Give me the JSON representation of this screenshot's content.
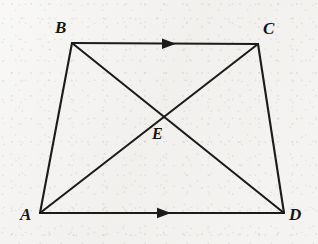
{
  "figure": {
    "background_color": "#f3f2f0",
    "line_color": "#1b1b1b",
    "label_color": "#151515",
    "width": 318,
    "height": 244
  },
  "points": {
    "A": {
      "label": "A",
      "x": 40,
      "y": 213,
      "label_x": 20,
      "label_y": 206
    },
    "B": {
      "label": "B",
      "x": 72,
      "y": 43,
      "label_x": 55,
      "label_y": 19
    },
    "C": {
      "label": "C",
      "x": 258,
      "y": 44,
      "label_x": 263,
      "label_y": 20
    },
    "D": {
      "label": "D",
      "x": 284,
      "y": 213,
      "label_x": 289,
      "label_y": 206
    },
    "E": {
      "label": "E",
      "x": 165,
      "y": 118,
      "label_x": 152,
      "label_y": 126
    }
  },
  "segments": [
    {
      "name": "side-ab",
      "from": "A",
      "to": "B",
      "kind": "side",
      "mark": "none"
    },
    {
      "name": "side-bc",
      "from": "B",
      "to": "C",
      "kind": "side",
      "mark": "single-arrow"
    },
    {
      "name": "side-cd",
      "from": "C",
      "to": "D",
      "kind": "side",
      "mark": "none"
    },
    {
      "name": "side-ad",
      "from": "A",
      "to": "D",
      "kind": "side",
      "mark": "single-arrow"
    },
    {
      "name": "diagonal-ac",
      "from": "A",
      "to": "C",
      "kind": "diagonal",
      "mark": "none"
    },
    {
      "name": "diagonal-bd",
      "from": "B",
      "to": "D",
      "kind": "diagonal",
      "mark": "none"
    }
  ],
  "parallel_marks": [
    {
      "name": "parallel-mark-bc",
      "on_segment": "side-bc",
      "x": 170,
      "y": 43.7,
      "direction": "right"
    },
    {
      "name": "parallel-mark-ad",
      "on_segment": "side-ad",
      "x": 165,
      "y": 213,
      "direction": "right"
    }
  ]
}
